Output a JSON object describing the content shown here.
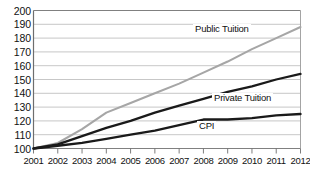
{
  "chart_data": {
    "type": "line",
    "title": "",
    "xlabel": "",
    "ylabel": "",
    "x": [
      2001,
      2002,
      2003,
      2004,
      2005,
      2006,
      2007,
      2008,
      2009,
      2010,
      2011,
      2012
    ],
    "categories": [
      "2001",
      "2002",
      "2003",
      "2004",
      "2005",
      "2006",
      "2007",
      "2008",
      "2009",
      "2010",
      "2011",
      "2012"
    ],
    "ylim": [
      100,
      200
    ],
    "xlim": [
      2001,
      2012
    ],
    "yticks": [
      100,
      110,
      120,
      130,
      140,
      150,
      160,
      170,
      180,
      190,
      200
    ],
    "ytick_labels": [
      "100",
      "110",
      "120",
      "130",
      "140",
      "150",
      "160",
      "170",
      "180",
      "190",
      "200"
    ],
    "grid": "horizontal",
    "legend_position": "inline-annotations",
    "series": [
      {
        "name": "Public Tuition",
        "color": "#a6a6a6",
        "label_text": "Public Tuition",
        "values": [
          100,
          104,
          114,
          126,
          133,
          140,
          147,
          155,
          163,
          172,
          180,
          188
        ]
      },
      {
        "name": "Private Tuition",
        "color": "#1a1a1a",
        "label_text": "Private Tuition",
        "values": [
          100,
          103,
          109,
          115,
          120,
          126,
          131,
          136,
          141,
          145,
          150,
          154
        ]
      },
      {
        "name": "CPI",
        "color": "#1a1a1a",
        "label_text": "CPI",
        "values": [
          100,
          102,
          104,
          107,
          110,
          113,
          117,
          121,
          121,
          122,
          124,
          125
        ]
      }
    ]
  }
}
